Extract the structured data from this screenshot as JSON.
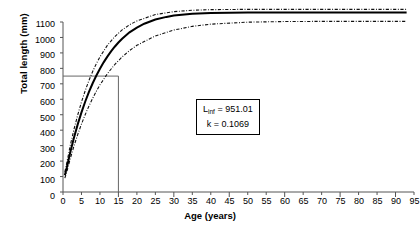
{
  "chart_data": {
    "type": "line",
    "title": "",
    "xlabel": "Age (years)",
    "ylabel": "Total length (mm)",
    "xlim": [
      0,
      95
    ],
    "ylim": [
      0,
      1100
    ],
    "xticks": [
      0,
      5,
      10,
      15,
      20,
      25,
      30,
      35,
      40,
      45,
      50,
      55,
      60,
      65,
      70,
      75,
      80,
      85,
      90,
      95
    ],
    "yticks": [
      0,
      100,
      200,
      300,
      400,
      500,
      600,
      700,
      800,
      900,
      1000,
      1100
    ],
    "grid": false,
    "legend_position": "none",
    "model": "von Bertalanffy growth function",
    "equation": "L(t) = Linf * (1 - exp(-k * (t - t0)))",
    "parameters": {
      "Linf_label": "L",
      "Linf_subscript": "inf",
      "Linf_text": " = 951.01",
      "Linf_value": 951.01,
      "k_text": "k = 0.1069",
      "k_value": 0.1069,
      "t0_value": -0.62
    },
    "annotation_lines": [
      "L_inf = 951.01",
      "k = 0.1069"
    ],
    "reference_lines": {
      "horizontal_y": 750,
      "vertical_x": 15,
      "description": "Reference lines marking age 15 years at ~750 mm total length"
    },
    "series": [
      {
        "name": "Fitted von Bertalanffy curve",
        "style": "solid",
        "color": "#000000",
        "x": [
          0.5,
          1,
          2,
          3,
          4,
          5,
          6,
          7,
          8,
          9,
          10,
          11,
          12,
          13,
          14,
          15,
          16,
          18,
          20,
          22,
          25,
          28,
          30,
          35,
          40,
          45,
          50,
          55,
          60,
          65,
          70,
          75,
          80,
          85,
          90,
          93
        ],
        "y": [
          108,
          155,
          260,
          354,
          439,
          515,
          584,
          646,
          702,
          752,
          798,
          839,
          876,
          910,
          940,
          967,
          992,
          1033,
          1064,
          1089,
          1116,
          1133,
          1142,
          1154,
          1159,
          1160,
          1161,
          1161,
          1161,
          1161,
          1161,
          1161,
          1161,
          1161,
          1161,
          1161
        ]
      },
      {
        "name": "Upper confidence limit",
        "style": "dash-dot",
        "color": "#000000",
        "x": [
          0.5,
          1,
          2,
          3,
          4,
          5,
          6,
          7,
          8,
          9,
          10,
          12,
          14,
          16,
          18,
          20,
          25,
          30,
          35,
          40,
          50,
          60,
          70,
          80,
          90,
          93
        ],
        "y": [
          130,
          185,
          305,
          408,
          500,
          582,
          655,
          720,
          778,
          829,
          874,
          949,
          1005,
          1049,
          1082,
          1107,
          1148,
          1167,
          1176,
          1180,
          1182,
          1182,
          1182,
          1182,
          1182,
          1182
        ]
      },
      {
        "name": "Lower confidence limit",
        "style": "dash-dot",
        "color": "#000000",
        "x": [
          0.5,
          1,
          2,
          3,
          4,
          5,
          6,
          7,
          8,
          9,
          10,
          12,
          14,
          16,
          18,
          20,
          25,
          30,
          35,
          40,
          50,
          60,
          70,
          80,
          90,
          93
        ],
        "y": [
          90,
          128,
          218,
          300,
          373,
          440,
          500,
          555,
          605,
          651,
          693,
          765,
          825,
          874,
          915,
          949,
          1010,
          1048,
          1072,
          1086,
          1099,
          1103,
          1104,
          1104,
          1104,
          1104
        ]
      }
    ]
  },
  "axes": {
    "y_tick_labels": [
      "1100",
      "1000",
      "900",
      "800",
      "700",
      "600",
      "500",
      "400",
      "300",
      "200",
      "100",
      "0"
    ],
    "x_tick_labels": [
      "0",
      "5",
      "10",
      "15",
      "20",
      "25",
      "30",
      "35",
      "40",
      "45",
      "50",
      "55",
      "60",
      "65",
      "70",
      "75",
      "80",
      "85",
      "90",
      "95"
    ]
  }
}
